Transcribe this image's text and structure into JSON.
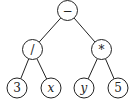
{
  "diagram": {
    "type": "expression-tree",
    "nodes": [
      {
        "id": "root",
        "label": "−",
        "x": 67.5,
        "y": 10.5,
        "italic": false
      },
      {
        "id": "div",
        "label": "/",
        "x": 32.5,
        "y": 49.5,
        "italic": false
      },
      {
        "id": "mul",
        "label": "*",
        "x": 101.5,
        "y": 49.5,
        "italic": false
      },
      {
        "id": "n3",
        "label": "3",
        "x": 17,
        "y": 88,
        "italic": false
      },
      {
        "id": "nx",
        "label": "x",
        "x": 51,
        "y": 88,
        "italic": true
      },
      {
        "id": "ny",
        "label": "y",
        "x": 84,
        "y": 88,
        "italic": true
      },
      {
        "id": "n5",
        "label": "5",
        "x": 118,
        "y": 88,
        "italic": false
      }
    ],
    "edges": [
      [
        "root",
        "div"
      ],
      [
        "root",
        "mul"
      ],
      [
        "div",
        "n3"
      ],
      [
        "div",
        "nx"
      ],
      [
        "mul",
        "ny"
      ],
      [
        "mul",
        "n5"
      ]
    ],
    "radius": 10
  }
}
